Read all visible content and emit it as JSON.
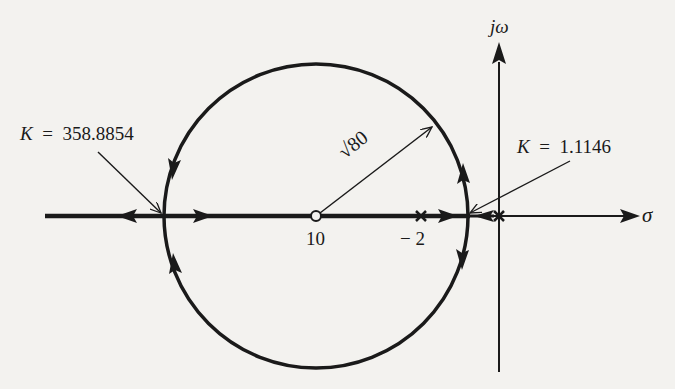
{
  "diagram": {
    "type": "root-locus",
    "axes": {
      "real_axis_label": "σ",
      "imag_axis_label": "jω"
    },
    "annotations": {
      "k_left_var": "K",
      "k_left_eq": "=",
      "k_left_value": "358.8854",
      "k_right_var": "K",
      "k_right_eq": "=",
      "k_right_value": "1.1146",
      "radius_label": "√80"
    },
    "points": {
      "zero_label": "10",
      "pole1_label": "− 2"
    },
    "colors": {
      "ink": "#1a1a1a",
      "background": "#f3f2ef"
    }
  }
}
